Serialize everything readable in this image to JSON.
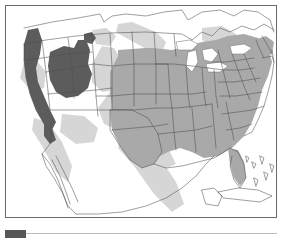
{
  "figure": {
    "kind": "thematic-map",
    "region": "United States and northern Mexico",
    "legend": {
      "swatch_label": "",
      "swatch_color": "#575757"
    },
    "frame_color": "#6a6a6a",
    "background_color": "#ffffff"
  },
  "map_data": {
    "type": "choropleth",
    "projection": "conic",
    "classes": [
      {
        "id": "high",
        "color": "#575757",
        "label": ""
      },
      {
        "id": "medium",
        "color": "#a8a8a8",
        "label": ""
      },
      {
        "id": "low",
        "color": "#d2d2d2",
        "label": ""
      },
      {
        "id": "none",
        "color": "#ffffff",
        "label": ""
      }
    ],
    "outline_color": "#555555",
    "water_color": "#ffffff",
    "features": {
      "dark_regions": [
        "Pacific coast strip (California/Oregon)",
        "Nevada",
        "Utah"
      ],
      "medium_regions": [
        "North Dakota",
        "South Dakota",
        "Nebraska",
        "Kansas",
        "Oklahoma",
        "Texas",
        "Minnesota",
        "Iowa",
        "Missouri",
        "Arkansas",
        "Louisiana",
        "Wisconsin",
        "Illinois",
        "Michigan",
        "Indiana",
        "Ohio",
        "Kentucky",
        "Tennessee",
        "Mississippi",
        "Alabama",
        "Georgia",
        "Florida",
        "South Carolina",
        "North Carolina",
        "Virginia",
        "West Virginia",
        "Pennsylvania",
        "New York",
        "New Jersey",
        "Maryland",
        "Delaware",
        "Connecticut",
        "Rhode Island",
        "Massachusetts",
        "Vermont",
        "New Hampshire",
        "Maine"
      ],
      "light_band_regions": [
        "Rocky Mountain corridor",
        "northern plains band",
        "Sierra Madre Occidental",
        "Baja peninsula margin"
      ],
      "unshaded_regions": [
        "Washington",
        "Oregon interior",
        "Idaho",
        "Montana",
        "Wyoming",
        "Colorado",
        "New Mexico",
        "Arizona"
      ],
      "water_bodies": [
        "Great Lakes",
        "Gulf of Mexico",
        "Pacific Ocean",
        "Atlantic Ocean"
      ],
      "neighbor_landmasses": [
        "Canada",
        "Mexico",
        "Cuba",
        "Bahamas"
      ]
    }
  }
}
